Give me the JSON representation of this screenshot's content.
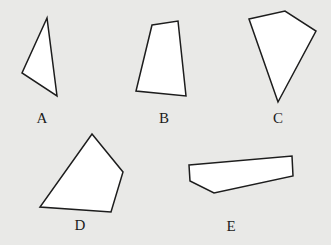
{
  "figure": {
    "background_color": "#e9e9e7",
    "stroke_color": "#1d1d1d",
    "fill_color": "#ffffff",
    "label_color": "#1b1b1b",
    "width": 331,
    "height": 245
  },
  "shapes": [
    {
      "id": "shape-a",
      "label": "A",
      "kind": "triangle",
      "sides": 3,
      "points": "47,18 22,73 57,96",
      "label_x": 32,
      "label_y": 111
    },
    {
      "id": "shape-b",
      "label": "B",
      "kind": "quadrilateral",
      "sides": 4,
      "points": "152,25 178,21 186,96 136,91",
      "label_x": 154,
      "label_y": 111
    },
    {
      "id": "shape-c",
      "label": "C",
      "kind": "quadrilateral",
      "sides": 4,
      "points": "249,19 285,11 316,31 278,102",
      "label_x": 268,
      "label_y": 111
    },
    {
      "id": "shape-d",
      "label": "D",
      "kind": "quadrilateral",
      "sides": 4,
      "points": "92,134 123,172 111,212 40,207",
      "label_x": 70,
      "label_y": 218
    },
    {
      "id": "shape-e",
      "label": "E",
      "kind": "pentagon",
      "sides": 5,
      "points": "189,165 292,156 293,176 214,193 190,181",
      "label_x": 221,
      "label_y": 219
    }
  ]
}
